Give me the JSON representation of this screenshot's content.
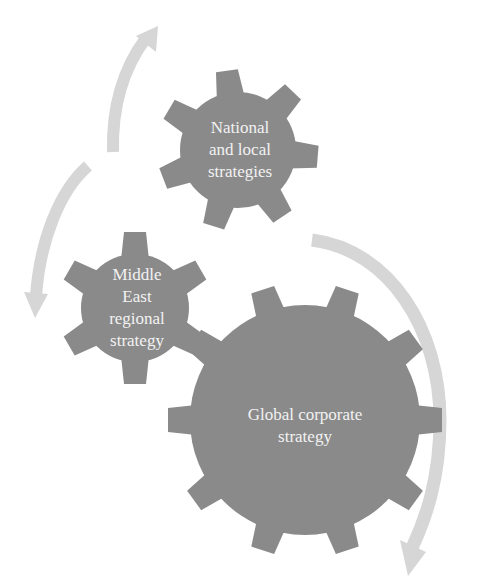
{
  "diagram": {
    "type": "gear-cycle",
    "colors": {
      "background": "#ffffff",
      "gear_fill": "#8a8a8a",
      "arrow_fill": "#d6d6d6",
      "label_text": "#f2f2f2"
    },
    "gears": [
      {
        "id": "national",
        "label_lines": [
          "National",
          "and local",
          "strategies"
        ],
        "center": [
          238,
          150
        ],
        "body_radius": 58,
        "tooth_radius": 80,
        "teeth": 7
      },
      {
        "id": "regional",
        "label_lines": [
          "Middle",
          "East",
          "regional",
          "strategy"
        ],
        "center": [
          135,
          308
        ],
        "body_radius": 54,
        "tooth_radius": 76,
        "teeth": 6
      },
      {
        "id": "global",
        "label_lines": [
          "Global corporate",
          "strategy"
        ],
        "center": [
          305,
          420
        ],
        "body_radius": 115,
        "tooth_radius": 137,
        "teeth": 10
      }
    ],
    "arrows": [
      {
        "id": "arrow-up-top",
        "direction": "up",
        "from": "regional",
        "to": "national"
      },
      {
        "id": "arrow-down-left",
        "direction": "down",
        "from": "national",
        "to": "regional"
      },
      {
        "id": "arrow-down-right",
        "direction": "down",
        "from": "national",
        "to": "global"
      }
    ]
  },
  "labels": {
    "national": {
      "line1": "National",
      "line2": "and local",
      "line3": "strategies"
    },
    "regional": {
      "line1": "Middle",
      "line2": "East",
      "line3": "regional",
      "line4": "strategy"
    },
    "global": {
      "line1": "Global corporate",
      "line2": "strategy"
    }
  }
}
